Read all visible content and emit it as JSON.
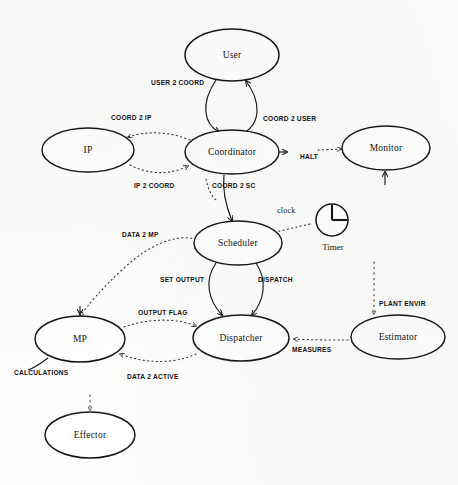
{
  "diagram": {
    "background_color": "#fdfdfc",
    "stroke_color": "#171717",
    "nodes": [
      {
        "id": "user",
        "label": "User",
        "cx": 232,
        "cy": 55,
        "rx": 47,
        "ry": 26
      },
      {
        "id": "ip",
        "label": "IP",
        "cx": 88,
        "cy": 150,
        "rx": 46,
        "ry": 22
      },
      {
        "id": "coordinator",
        "label": "Coordinator",
        "cx": 232,
        "cy": 152,
        "rx": 47,
        "ry": 22
      },
      {
        "id": "monitor",
        "label": "Monitor",
        "cx": 386,
        "cy": 148,
        "rx": 44,
        "ry": 22
      },
      {
        "id": "scheduler",
        "label": "Scheduler",
        "cx": 238,
        "cy": 243,
        "rx": 44,
        "ry": 22
      },
      {
        "id": "mp",
        "label": "MP",
        "cx": 80,
        "cy": 339,
        "rx": 45,
        "ry": 23
      },
      {
        "id": "dispatcher",
        "label": "Dispatcher",
        "cx": 241,
        "cy": 338,
        "rx": 48,
        "ry": 23
      },
      {
        "id": "estimator",
        "label": "Estimator",
        "cx": 398,
        "cy": 337,
        "rx": 47,
        "ry": 22
      },
      {
        "id": "effector",
        "label": "Effector",
        "cx": 90,
        "cy": 435,
        "rx": 45,
        "ry": 23
      }
    ],
    "icons": [
      {
        "id": "timer",
        "name": "clock-icon",
        "label": "Timer",
        "cx": 332,
        "cy": 220,
        "r": 16
      }
    ],
    "edge_labels": [
      {
        "id": "user-2-coord",
        "text": "USER 2 COORD",
        "x": 151,
        "y": 85
      },
      {
        "id": "coord-2-user",
        "text": "COORD 2 USER",
        "x": 263,
        "y": 121
      },
      {
        "id": "coord-2-ip",
        "text": "COORD 2 IP",
        "x": 111,
        "y": 120
      },
      {
        "id": "ip-2-coord",
        "text": "IP 2 COORD",
        "x": 134,
        "y": 188
      },
      {
        "id": "coord-2-sc",
        "text": "COORD 2 SC",
        "x": 212,
        "y": 188
      },
      {
        "id": "halt",
        "text": "HALT",
        "x": 300,
        "y": 159
      },
      {
        "id": "clock",
        "text": "clock",
        "x": 277,
        "y": 213
      },
      {
        "id": "data-2-mp",
        "text": "DATA 2 MP",
        "x": 122,
        "y": 237
      },
      {
        "id": "set-output",
        "text": "SET OUTPUT",
        "x": 160,
        "y": 282
      },
      {
        "id": "dispatch",
        "text": "DISPATCH",
        "x": 258,
        "y": 282
      },
      {
        "id": "output-flag",
        "text": "OUTPUT FLAG",
        "x": 138,
        "y": 315
      },
      {
        "id": "data-2-active",
        "text": "DATA 2 ACTIVE",
        "x": 127,
        "y": 379
      },
      {
        "id": "calculations",
        "text": "CALCULATIONS",
        "x": 14,
        "y": 375
      },
      {
        "id": "measures",
        "text": "MEASURES",
        "x": 292,
        "y": 352
      },
      {
        "id": "plant-envir",
        "text": "PLANT ENVIR",
        "x": 379,
        "y": 306
      }
    ]
  }
}
